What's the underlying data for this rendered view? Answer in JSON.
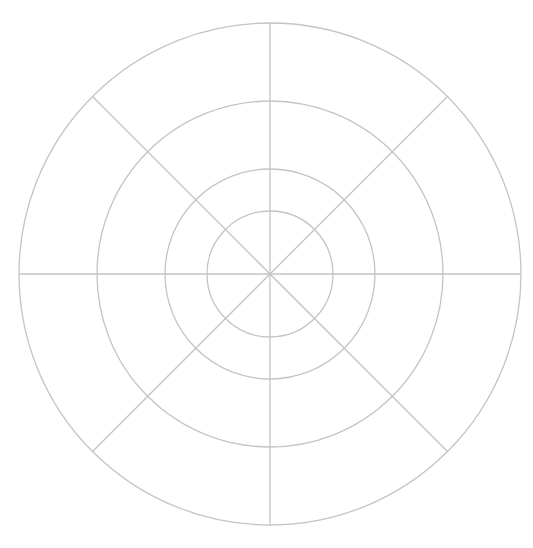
{
  "diagram": {
    "type": "polar-grid",
    "center": [
      270,
      274
    ],
    "rings": [
      251,
      173,
      105,
      63
    ],
    "spokes_deg": [
      0,
      45,
      90,
      135
    ],
    "line_color": "#c4c4c4",
    "background": "#ffffff"
  }
}
